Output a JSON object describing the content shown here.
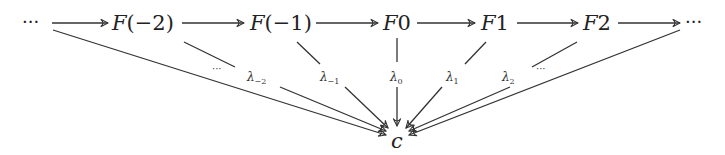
{
  "diagram": {
    "type": "colimit-cocone",
    "nodes": {
      "left_dots": "···",
      "f_m2": "F(−2)",
      "f_m1": "F(−1)",
      "f_0": "F0",
      "f_1": "F1",
      "f_2": "F2",
      "right_dots": "···",
      "apex": "c"
    },
    "labels": {
      "left_dots": "···",
      "lambda_m2": {
        "base": "λ",
        "sub": "−2"
      },
      "lambda_m1": {
        "base": "λ",
        "sub": "−1"
      },
      "lambda_0": {
        "base": "λ",
        "sub": "0"
      },
      "lambda_1": {
        "base": "λ",
        "sub": "1"
      },
      "lambda_2": {
        "base": "λ",
        "sub": "2"
      },
      "right_dots": "···"
    },
    "edges": [
      {
        "from": "left_dots",
        "to": "f_m2"
      },
      {
        "from": "f_m2",
        "to": "f_m1"
      },
      {
        "from": "f_m1",
        "to": "f_0"
      },
      {
        "from": "f_0",
        "to": "f_1"
      },
      {
        "from": "f_1",
        "to": "f_2"
      },
      {
        "from": "f_2",
        "to": "right_dots"
      },
      {
        "from": "left_dots",
        "to": "apex"
      },
      {
        "from": "f_m2",
        "to": "apex",
        "label": "λ_-2"
      },
      {
        "from": "f_m1",
        "to": "apex",
        "label": "λ_-1"
      },
      {
        "from": "f_0",
        "to": "apex",
        "label": "λ_0"
      },
      {
        "from": "f_1",
        "to": "apex",
        "label": "λ_1"
      },
      {
        "from": "f_2",
        "to": "apex",
        "label": "λ_2"
      },
      {
        "from": "right_dots",
        "to": "apex"
      }
    ]
  }
}
